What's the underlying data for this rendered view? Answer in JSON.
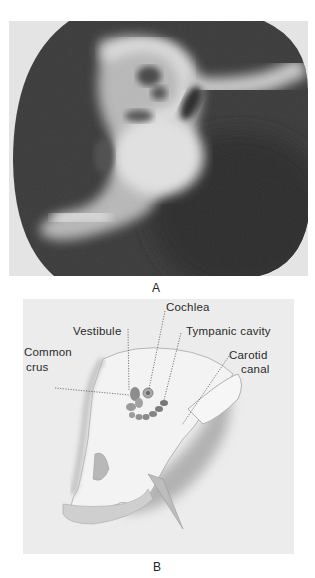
{
  "figure": {
    "panels": [
      {
        "letter": "A",
        "kind": "radiograph",
        "description": "Tomographic X-ray of temporal bone showing cochlea, vestibule and tympanic cavity"
      },
      {
        "letter": "B",
        "kind": "anatomical-drawing",
        "labels": {
          "cochlea": "Cochlea",
          "vestibule": "Vestibule",
          "tympanic_cavity": "Tympanic cavity",
          "common_crus_line1": "Common",
          "common_crus_line2": "crus",
          "carotid_canal_line1": "Carotid",
          "carotid_canal_line2": "canal"
        }
      }
    ]
  },
  "colors": {
    "background": "#ffffff",
    "radiograph_dark": "#3a3a3a",
    "radiograph_bright": "#e6e6e6",
    "drawing_bg": "#ececec",
    "label_text": "#2a2a2a"
  }
}
